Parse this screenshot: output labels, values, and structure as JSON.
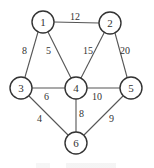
{
  "graph": {
    "nodes": [
      {
        "id": "1",
        "x": 43,
        "y": 22
      },
      {
        "id": "2",
        "x": 110,
        "y": 23
      },
      {
        "id": "3",
        "x": 21,
        "y": 88
      },
      {
        "id": "4",
        "x": 76,
        "y": 88
      },
      {
        "id": "5",
        "x": 131,
        "y": 88
      },
      {
        "id": "6",
        "x": 76,
        "y": 143
      }
    ],
    "edges": [
      {
        "from": "1",
        "to": "2",
        "weight": "12"
      },
      {
        "from": "1",
        "to": "3",
        "weight": "8"
      },
      {
        "from": "1",
        "to": "4",
        "weight": "5"
      },
      {
        "from": "2",
        "to": "4",
        "weight": "15"
      },
      {
        "from": "2",
        "to": "5",
        "weight": "20"
      },
      {
        "from": "3",
        "to": "4",
        "weight": "6"
      },
      {
        "from": "4",
        "to": "5",
        "weight": "10"
      },
      {
        "from": "3",
        "to": "6",
        "weight": "4"
      },
      {
        "from": "4",
        "to": "6",
        "weight": "8"
      },
      {
        "from": "5",
        "to": "6",
        "weight": "9"
      }
    ]
  },
  "labels": {
    "node_1": "1",
    "node_2": "2",
    "node_3": "3",
    "node_4": "4",
    "node_5": "5",
    "node_6": "6",
    "w_1_2": "12",
    "w_1_3": "8",
    "w_1_4": "5",
    "w_2_4": "15",
    "w_2_5": "20",
    "w_3_4": "6",
    "w_4_5": "10",
    "w_3_6": "4",
    "w_4_6": "8",
    "w_5_6": "9"
  }
}
